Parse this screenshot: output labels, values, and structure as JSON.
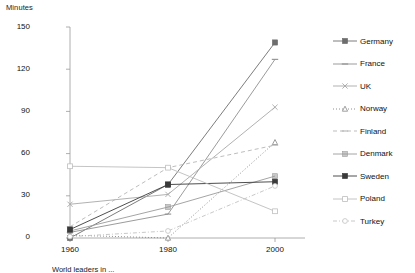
{
  "chart_data": {
    "type": "line",
    "title": "",
    "xlabel": "",
    "ylabel": "Minutes",
    "x": [
      1960,
      1980,
      2000
    ],
    "categories": [
      "1960",
      "1980",
      "2000"
    ],
    "ylim": [
      0,
      150
    ],
    "yticks": [
      0,
      30,
      60,
      90,
      120,
      150
    ],
    "xticks": [
      "1960",
      "1980",
      "2000"
    ],
    "grid": false,
    "legend_position": "right",
    "series": [
      {
        "name": "Germany",
        "values": [
          0,
          38,
          139
        ],
        "marker": "filled-square",
        "line": "solid",
        "color": "#6d6d6d"
      },
      {
        "name": "France",
        "values": [
          4,
          17,
          127
        ],
        "marker": "dash",
        "line": "solid",
        "color": "#909090"
      },
      {
        "name": "UK",
        "values": [
          24,
          31,
          93
        ],
        "marker": "cross",
        "line": "solid",
        "color": "#a8a8a8"
      },
      {
        "name": "Norway",
        "values": [
          2,
          0,
          68
        ],
        "marker": "triangle",
        "line": "dotted",
        "color": "#858585"
      },
      {
        "name": "Finland",
        "values": [
          8,
          50,
          66
        ],
        "marker": "dash",
        "line": "dashed",
        "color": "#b5b5b5"
      },
      {
        "name": "Denmark",
        "values": [
          5,
          22,
          44
        ],
        "marker": "square",
        "line": "solid",
        "color": "#9a9a9a"
      },
      {
        "name": "Sweden",
        "values": [
          6,
          38,
          40
        ],
        "marker": "filled-square",
        "line": "solid",
        "color": "#3a3a3a"
      },
      {
        "name": "Poland",
        "values": [
          51,
          50,
          19
        ],
        "marker": "open-square",
        "line": "solid",
        "color": "#bdbdbd"
      },
      {
        "name": "Turkey",
        "values": [
          1,
          5,
          37
        ],
        "marker": "open-circle",
        "line": "dashdot",
        "color": "#c2c2c2"
      }
    ]
  },
  "axis": {
    "y_label": "Minutes",
    "y_ticks": [
      "150",
      "120",
      "90",
      "60",
      "30",
      "0"
    ],
    "x_ticks": [
      "1960",
      "1980",
      "2000"
    ]
  },
  "legend": {
    "items": [
      {
        "label": "Germany"
      },
      {
        "label": "France"
      },
      {
        "label": "UK"
      },
      {
        "label": "Norway"
      },
      {
        "label": "Finland"
      },
      {
        "label": "Denmark"
      },
      {
        "label": "Sweden"
      },
      {
        "label": "Poland"
      },
      {
        "label": "Turkey"
      }
    ]
  },
  "caption": {
    "text": "World leaders in ... "
  }
}
